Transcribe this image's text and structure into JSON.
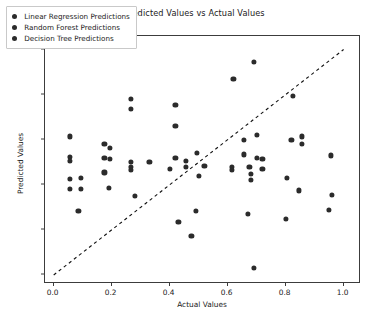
{
  "chart_data": {
    "type": "scatter",
    "title": "Predicted Values vs Actual Values",
    "xlabel": "Actual Values",
    "ylabel": "Predicted Values",
    "xlim": [
      -0.03,
      1.06
    ],
    "ylim": [
      -0.04,
      1.06
    ],
    "xticks": [
      "0.0",
      "0.2",
      "0.4",
      "0.6",
      "0.8",
      "1.0"
    ],
    "xtick_values": [
      0.0,
      0.2,
      0.4,
      0.6,
      0.8,
      1.0
    ],
    "yticks": [
      "0.0",
      "0.2",
      "0.4",
      "0.6",
      "0.8",
      "1.0"
    ],
    "ytick_values": [
      0.0,
      0.2,
      0.4,
      0.6,
      0.8,
      1.0
    ],
    "grid": false,
    "legend_position": "upper left",
    "marker_color": "#2b2b2b",
    "reference_line": {
      "style": "dashed",
      "color": "#111111",
      "from": [
        0.0,
        0.0
      ],
      "to": [
        1.0,
        1.0
      ]
    },
    "series": [
      {
        "name": "Linear Regression Predictions",
        "marker": "circle",
        "color": "#2b2b2b",
        "points": [
          [
            0.055,
            0.615
          ],
          [
            0.055,
            0.525
          ],
          [
            0.055,
            0.505
          ],
          [
            0.055,
            0.425
          ],
          [
            0.095,
            0.43
          ],
          [
            0.055,
            0.38
          ],
          [
            0.095,
            0.38
          ],
          [
            0.085,
            0.285
          ],
          [
            0.175,
            0.58
          ],
          [
            0.195,
            0.565
          ],
          [
            0.175,
            0.52
          ],
          [
            0.195,
            0.515
          ],
          [
            0.175,
            0.455
          ],
          [
            0.19,
            0.385
          ]
        ]
      },
      {
        "name": "Random Forest Predictions",
        "marker": "circle",
        "color": "#2b2b2b",
        "points": [
          [
            0.265,
            0.78
          ],
          [
            0.265,
            0.735
          ],
          [
            0.265,
            0.5
          ],
          [
            0.265,
            0.48
          ],
          [
            0.265,
            0.465
          ],
          [
            0.33,
            0.5
          ],
          [
            0.28,
            0.35
          ],
          [
            0.42,
            0.755
          ],
          [
            0.42,
            0.66
          ],
          [
            0.42,
            0.52
          ],
          [
            0.455,
            0.505
          ],
          [
            0.455,
            0.48
          ],
          [
            0.4,
            0.47
          ],
          [
            0.495,
            0.54
          ],
          [
            0.52,
            0.485
          ],
          [
            0.5,
            0.44
          ],
          [
            0.43,
            0.235
          ],
          [
            0.49,
            0.285
          ],
          [
            0.475,
            0.175
          ],
          [
            0.69,
            0.945
          ]
        ]
      },
      {
        "name": "Decision Tree Predictions",
        "marker": "circle",
        "color": "#2b2b2b",
        "points": [
          [
            0.62,
            0.87
          ],
          [
            0.655,
            0.6
          ],
          [
            0.7,
            0.62
          ],
          [
            0.655,
            0.535
          ],
          [
            0.7,
            0.52
          ],
          [
            0.72,
            0.515
          ],
          [
            0.615,
            0.48
          ],
          [
            0.615,
            0.465
          ],
          [
            0.675,
            0.48
          ],
          [
            0.68,
            0.45
          ],
          [
            0.72,
            0.47
          ],
          [
            0.68,
            0.42
          ],
          [
            0.67,
            0.27
          ],
          [
            0.69,
            0.03
          ],
          [
            0.82,
            0.6
          ],
          [
            0.855,
            0.615
          ],
          [
            0.855,
            0.58
          ],
          [
            0.825,
            0.795
          ],
          [
            0.805,
            0.43
          ],
          [
            0.845,
            0.375
          ],
          [
            0.8,
            0.25
          ],
          [
            0.955,
            0.53
          ],
          [
            0.96,
            0.355
          ],
          [
            0.95,
            0.29
          ]
        ]
      }
    ]
  },
  "legend": {
    "items": [
      {
        "label": "Linear Regression Predictions"
      },
      {
        "label": "Random Forest Predictions"
      },
      {
        "label": "Decision Tree Predictions"
      }
    ]
  }
}
